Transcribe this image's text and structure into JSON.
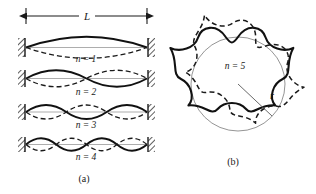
{
  "figure": {
    "panel_a": {
      "caption": "(a)",
      "dimension_label": "L",
      "modes": [
        {
          "label": "n = 1",
          "n": 1
        },
        {
          "label": "n = 2",
          "n": 2
        },
        {
          "label": "n = 3",
          "n": 3
        },
        {
          "label": "n = 4",
          "n": 4
        }
      ]
    },
    "panel_b": {
      "caption": "(b)",
      "mode_label": "n = 5",
      "radius_label": "r",
      "n": 5
    },
    "colors": {
      "ink": "#1a1a1a",
      "solid_wave": "#111111",
      "dashed_wave": "#1a1a1a",
      "guide_line": "#6a6a6a",
      "background": "#ffffff"
    }
  }
}
